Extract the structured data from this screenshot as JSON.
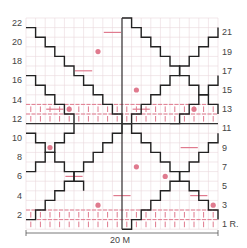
{
  "grid": {
    "stitches": 20,
    "rows": 22,
    "x0": 26,
    "y0": 18,
    "cell": 9.6,
    "colors": {
      "grid": "#ead7db",
      "grid_bg": "#ffffff",
      "outline": "#222222",
      "pattern": "#e07a8e",
      "center_line": "#333333"
    }
  },
  "labels": {
    "left_rows": [
      "22",
      "20",
      "18",
      "16",
      "14",
      "12",
      "10",
      "8",
      "6",
      "4",
      "2"
    ],
    "right_rows": [
      "21",
      "19",
      "17",
      "15",
      "13",
      "11",
      "9",
      "7",
      "5",
      "3",
      "1 R."
    ],
    "width": "20 M"
  },
  "dots": [
    [
      8,
      19
    ],
    [
      12,
      15
    ],
    [
      5,
      13
    ],
    [
      3,
      9
    ],
    [
      12,
      7
    ],
    [
      8,
      3
    ],
    [
      18,
      13
    ],
    [
      15,
      6
    ],
    [
      20,
      3
    ]
  ],
  "dashes": [
    [
      9,
      21
    ],
    [
      6,
      17
    ],
    [
      3,
      13
    ],
    [
      12,
      13
    ],
    [
      5,
      6
    ],
    [
      10,
      4
    ],
    [
      17,
      9
    ],
    [
      18,
      4
    ]
  ]
}
